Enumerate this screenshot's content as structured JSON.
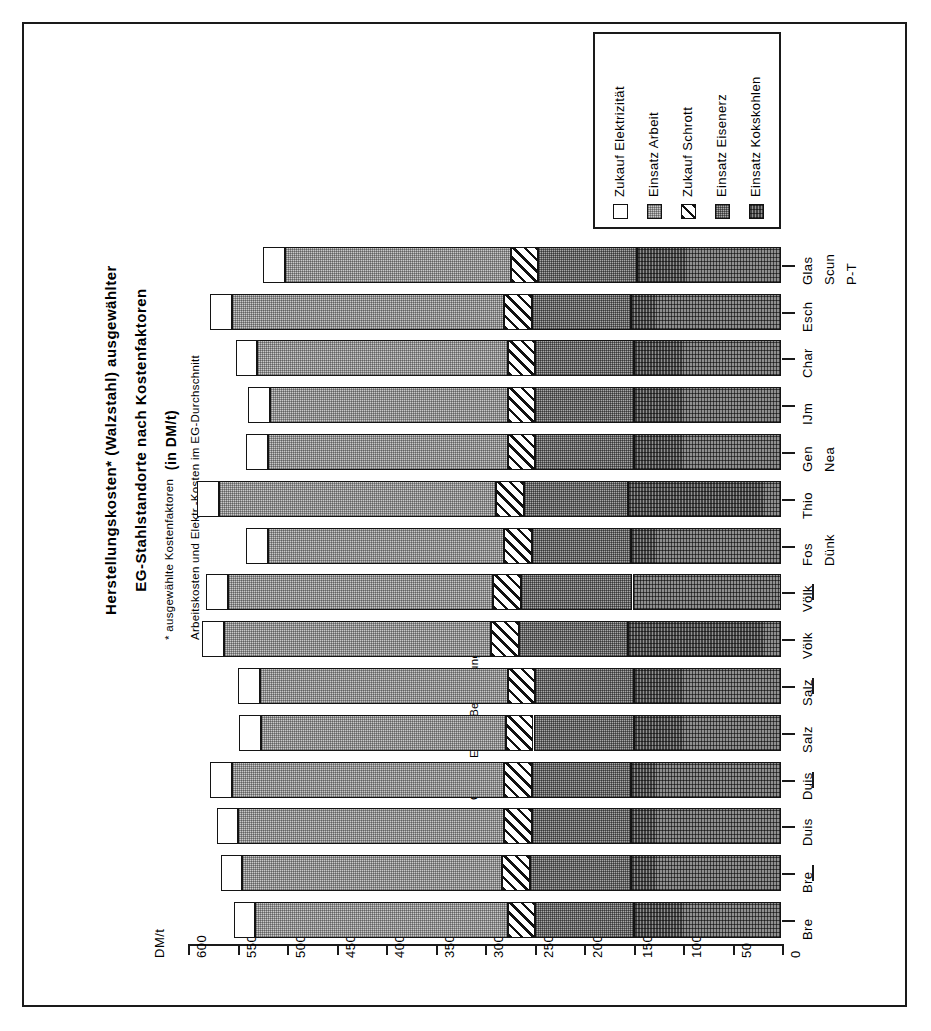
{
  "title": {
    "line1": "Herstellungskosten*  (Walzstahl)  ausgewählter",
    "line2": "EG-Stahlstandorte  nach  Kostenfaktoren",
    "line3": "(in   DM/t)"
  },
  "footnote": {
    "line1": "*  ausgewählte Kostenfaktoren",
    "line2": "Arbeitskosten und  Elektr.-Kosten  im  EG-Durchschnitt"
  },
  "source": "Quelle: Eigene Berechnungen",
  "axis": {
    "unit_label": "DM/t",
    "tick_labels": [
      "600",
      "550",
      "500",
      "450",
      "400",
      "350",
      "300",
      "250",
      "200",
      "150",
      "100",
      "50",
      "0"
    ]
  },
  "legend": {
    "title": "",
    "items": [
      {
        "label": "Zukauf  Elektrizität",
        "key": "elek",
        "swatch": "white-square"
      },
      {
        "label": "Einsatz  Arbeit",
        "key": "arbeit",
        "swatch": "dotted-square"
      },
      {
        "label": "Zukauf  Schrott",
        "key": "schrott",
        "swatch": "diagonal-square"
      },
      {
        "label": "Einsatz  Eisenerz",
        "key": "erz",
        "swatch": "dense-dotted-square"
      },
      {
        "label": "Einsatz  Kokskohlen",
        "key": "koks",
        "swatch": "grid-square"
      }
    ]
  },
  "chart_data": {
    "type": "bar",
    "orientation": "horizontal-stacked",
    "title": "Herstellungskosten* (Walzstahl) ausgewählter EG-Stahlstandorte nach Kostenfaktoren (in DM/t)",
    "xlabel": "DM/t",
    "ylabel": "",
    "xlim": [
      0,
      600
    ],
    "axis_direction": "reversed (600 at left, 0 at right)",
    "grid": false,
    "legend_position": "top-right",
    "categories": [
      "Bre",
      "Bre -",
      "Duis",
      "Duis -",
      "Salz",
      "Salz -",
      "Völk",
      "Völk -",
      "Fos / Dünk",
      "Thio",
      "Gen / Nea",
      "IJm",
      "Char",
      "Esch",
      "Glas / Scun / P-T"
    ],
    "category_labels": [
      {
        "l1": "Bre",
        "l2": ""
      },
      {
        "l1": "Bre",
        "l2": "dash"
      },
      {
        "l1": "Duis",
        "l2": ""
      },
      {
        "l1": "Duis",
        "l2": "dash"
      },
      {
        "l1": "Salz",
        "l2": ""
      },
      {
        "l1": "Salz",
        "l2": "dash"
      },
      {
        "l1": "Völk",
        "l2": ""
      },
      {
        "l1": "Völk",
        "l2": "dash"
      },
      {
        "l1": "Fos",
        "l2": "Dünk"
      },
      {
        "l1": "Thio",
        "l2": ""
      },
      {
        "l1": "Gen",
        "l2": "Nea"
      },
      {
        "l1": "IJm",
        "l2": ""
      },
      {
        "l1": "Char",
        "l2": ""
      },
      {
        "l1": "Esch",
        "l2": ""
      },
      {
        "l1": "Glas",
        "l2": "Scun",
        "l3": "P-T"
      }
    ],
    "series": [
      {
        "name": "Einsatz Kokskohlen",
        "key": "koks",
        "values": [
          148,
          152,
          152,
          152,
          148,
          148,
          155,
          150,
          152,
          155,
          148,
          148,
          148,
          152,
          145
        ]
      },
      {
        "name": "Einsatz Eisenerz",
        "key": "erz",
        "values": [
          100,
          102,
          100,
          100,
          102,
          100,
          110,
          113,
          100,
          105,
          100,
          100,
          100,
          100,
          100
        ]
      },
      {
        "name": "Zukauf Schrott",
        "key": "schrott",
        "values": [
          28,
          28,
          28,
          28,
          28,
          28,
          28,
          28,
          28,
          28,
          28,
          28,
          28,
          28,
          28
        ]
      },
      {
        "name": "Einsatz Arbeit",
        "key": "arbeit",
        "values": [
          255,
          262,
          268,
          275,
          247,
          250,
          270,
          268,
          238,
          280,
          242,
          240,
          253,
          275,
          228
        ]
      },
      {
        "name": "Zukauf Elektrizität",
        "key": "elek",
        "values": [
          22,
          22,
          22,
          22,
          22,
          22,
          22,
          22,
          22,
          22,
          22,
          22,
          22,
          22,
          22
        ]
      }
    ],
    "totals": [
      553,
      566,
      570,
      577,
      547,
      548,
      585,
      581,
      540,
      590,
      540,
      538,
      551,
      577,
      523
    ]
  }
}
